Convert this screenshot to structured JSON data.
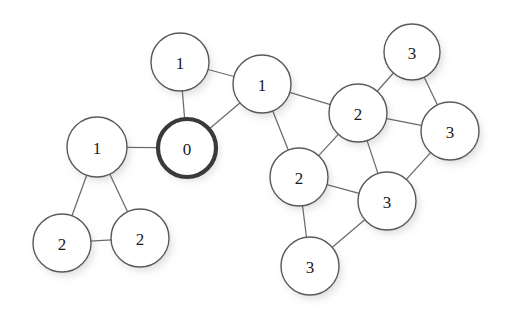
{
  "diagram": {
    "type": "undirected-graph",
    "title": "",
    "background_color": "#ffffff",
    "node_fill_color": "#ffffff",
    "node_stroke_color": "#5a5a5a",
    "root_node_stroke_color": "#3a3a3a",
    "edge_color": "#6a6a6a",
    "label_color": "#1a1a1a",
    "shadow_color": "#b8b8b8",
    "node_count": 13,
    "edge_count": 17,
    "nodes": [
      {
        "id": "n0",
        "label": "0",
        "cx": 187,
        "cy": 148,
        "r": 29,
        "root": true
      },
      {
        "id": "n1",
        "label": "1",
        "cx": 180,
        "cy": 62,
        "r": 29,
        "root": false
      },
      {
        "id": "n2",
        "label": "1",
        "cx": 262,
        "cy": 84,
        "r": 29,
        "root": false
      },
      {
        "id": "n3",
        "label": "1",
        "cx": 97,
        "cy": 147,
        "r": 30,
        "root": false
      },
      {
        "id": "n4",
        "label": "2",
        "cx": 62,
        "cy": 243,
        "r": 29,
        "root": false
      },
      {
        "id": "n5",
        "label": "2",
        "cx": 140,
        "cy": 238,
        "r": 29,
        "root": false
      },
      {
        "id": "n6",
        "label": "2",
        "cx": 358,
        "cy": 113,
        "r": 29,
        "root": false
      },
      {
        "id": "n7",
        "label": "2",
        "cx": 299,
        "cy": 177,
        "r": 29,
        "root": false
      },
      {
        "id": "n8",
        "label": "3",
        "cx": 412,
        "cy": 52,
        "r": 28,
        "root": false
      },
      {
        "id": "n9",
        "label": "3",
        "cx": 450,
        "cy": 131,
        "r": 29,
        "root": false
      },
      {
        "id": "n10",
        "label": "3",
        "cx": 387,
        "cy": 201,
        "r": 29,
        "root": false
      },
      {
        "id": "n11",
        "label": "3",
        "cx": 310,
        "cy": 266,
        "r": 29,
        "root": false
      }
    ],
    "edges": [
      {
        "from": "n1",
        "to": "n0"
      },
      {
        "from": "n1",
        "to": "n2"
      },
      {
        "from": "n0",
        "to": "n2"
      },
      {
        "from": "n0",
        "to": "n3"
      },
      {
        "from": "n3",
        "to": "n4"
      },
      {
        "from": "n3",
        "to": "n5"
      },
      {
        "from": "n4",
        "to": "n5"
      },
      {
        "from": "n2",
        "to": "n6"
      },
      {
        "from": "n2",
        "to": "n7"
      },
      {
        "from": "n6",
        "to": "n7"
      },
      {
        "from": "n6",
        "to": "n8"
      },
      {
        "from": "n6",
        "to": "n9"
      },
      {
        "from": "n6",
        "to": "n10"
      },
      {
        "from": "n8",
        "to": "n9"
      },
      {
        "from": "n9",
        "to": "n10"
      },
      {
        "from": "n7",
        "to": "n10"
      },
      {
        "from": "n7",
        "to": "n11"
      },
      {
        "from": "n10",
        "to": "n11"
      }
    ]
  }
}
